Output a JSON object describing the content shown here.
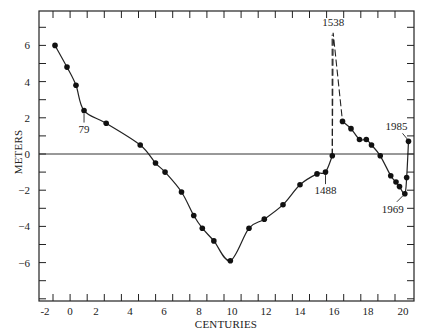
{
  "chart_data": {
    "type": "line",
    "title": "",
    "xlabel": "CENTURIES",
    "ylabel": "METERS",
    "xlim": [
      -2.6,
      20.6
    ],
    "ylim": [
      -8,
      8
    ],
    "grid": false,
    "legend": null,
    "x_ticks": [
      {
        "label": "-2",
        "value": -2
      },
      {
        "label": "0",
        "value": 0
      },
      {
        "label": "2",
        "value": 2
      },
      {
        "label": "4",
        "value": 4
      },
      {
        "label": "6",
        "value": 6
      },
      {
        "label": "8",
        "value": 8
      },
      {
        "label": "10",
        "value": 10
      },
      {
        "label": "12",
        "value": 12
      },
      {
        "label": "14",
        "value": 14
      },
      {
        "label": "16",
        "value": 16
      },
      {
        "label": "18",
        "value": 18
      },
      {
        "label": "20",
        "value": 20
      }
    ],
    "y_ticks": [
      {
        "label": "6",
        "value": 6
      },
      {
        "label": "4",
        "value": 4
      },
      {
        "label": "2",
        "value": 2
      },
      {
        "label": "0",
        "value": 0
      },
      {
        "label": "-2",
        "value": -2
      },
      {
        "label": "-4",
        "value": -4
      },
      {
        "label": "-6",
        "value": -6
      }
    ],
    "reference_line": {
      "y": 0
    },
    "series": [
      {
        "name": "Sea level (solid)",
        "style": "solid",
        "x": [
          -1.2,
          -0.24,
          0.46,
          1.08,
          2.6,
          4.6,
          5.5,
          6.06,
          7.0,
          7.7,
          8.2,
          8.9,
          9.9,
          11.0,
          11.9,
          13.0,
          14.0,
          15.0,
          15.5,
          15.9
        ],
        "y": [
          6.0,
          4.8,
          3.8,
          2.4,
          1.7,
          0.5,
          -0.5,
          -1.0,
          -2.1,
          -3.4,
          -4.1,
          -4.8,
          -5.9,
          -4.1,
          -3.6,
          -2.8,
          -1.7,
          -1.1,
          -1.0,
          -0.1
        ]
      },
      {
        "name": "1538 spike (dashed)",
        "style": "dashed",
        "x": [
          15.9,
          15.95,
          16.5
        ],
        "y": [
          -0.1,
          6.7,
          1.8
        ]
      },
      {
        "name": "Sea level after 1538 (solid)",
        "style": "solid",
        "x": [
          16.5,
          17.0,
          17.5,
          17.9,
          18.2,
          18.7,
          19.3,
          19.6,
          19.8,
          20.1,
          20.2,
          20.3
        ],
        "y": [
          1.8,
          1.4,
          0.8,
          0.8,
          0.5,
          -0.1,
          -1.2,
          -1.55,
          -1.8,
          -2.2,
          -1.3,
          0.7
        ]
      }
    ],
    "annotations": [
      {
        "text": "79",
        "x": 1.08,
        "y": 2.4,
        "position": "below"
      },
      {
        "text": "1488",
        "x": 15.5,
        "y": -1.0,
        "position": "below"
      },
      {
        "text": "1538",
        "x": 15.95,
        "y": 6.7,
        "position": "above"
      },
      {
        "text": "1969",
        "x": 20.1,
        "y": -2.2,
        "position": "below-left"
      },
      {
        "text": "1985",
        "x": 20.3,
        "y": 0.7,
        "position": "above-left"
      }
    ]
  }
}
